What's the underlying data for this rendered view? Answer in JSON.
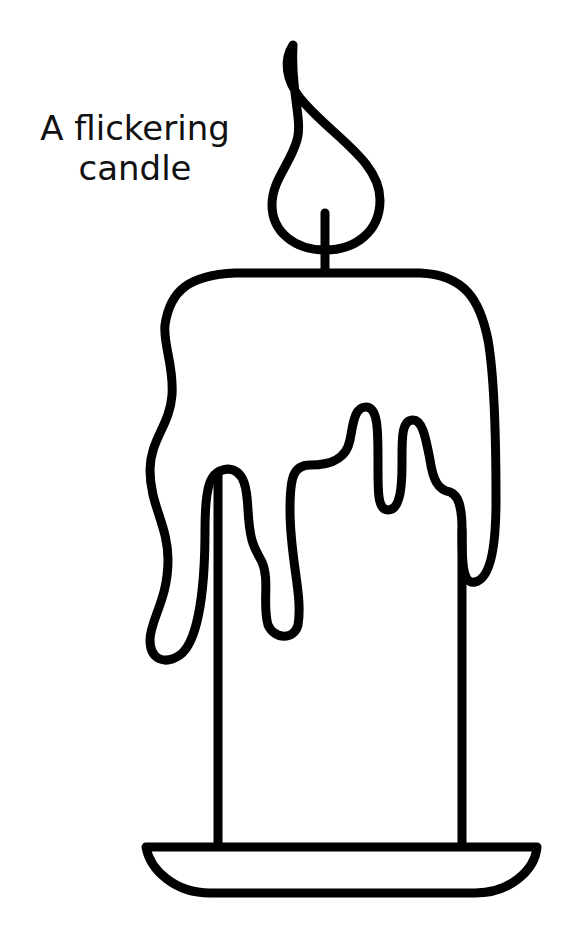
{
  "page": {
    "type": "coloring-page",
    "background": "#ffffff",
    "line_color": "#000000"
  },
  "title": {
    "line1": "A flickering",
    "line2": "candle"
  },
  "illustration": {
    "subject": "candle",
    "parts": [
      "flame",
      "wick",
      "melting-wax-top",
      "wax-drips",
      "candle-body",
      "candle-dish"
    ]
  }
}
